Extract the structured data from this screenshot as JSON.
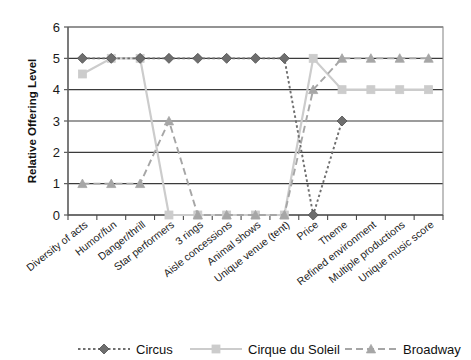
{
  "chart_data": {
    "type": "line",
    "title": "",
    "xlabel": "",
    "ylabel": "Relative Offering Level",
    "ylim": [
      0,
      6
    ],
    "yticks": [
      0,
      1,
      2,
      3,
      4,
      5,
      6
    ],
    "grid": true,
    "legend_position": "bottom",
    "categories": [
      "Diversity of acts",
      "Humor/fun",
      "Danger/thrill",
      "Star performers",
      "3 rings",
      "Aisle concessions",
      "Animal shows",
      "Unique venue (tent)",
      "Price",
      "Theme",
      "Refined environment",
      "Multiple productions",
      "Unique music score"
    ],
    "series": [
      {
        "name": "Circus",
        "color": "#6e6e6e",
        "marker": "diamond",
        "line_style": "dotted",
        "values": [
          5,
          5,
          5,
          5,
          5,
          5,
          5,
          5,
          0,
          3,
          null,
          null,
          null
        ]
      },
      {
        "name": "Cirque du Soleil",
        "color": "#cccccc",
        "marker": "square",
        "line_style": "solid",
        "values": [
          4.5,
          5,
          5,
          0,
          0,
          0,
          0,
          0,
          5,
          4,
          4,
          4,
          4
        ]
      },
      {
        "name": "Broadway",
        "color": "#a6a6a6",
        "marker": "triangle",
        "line_style": "dashed",
        "values": [
          1,
          1,
          1,
          3,
          0,
          0,
          0,
          0,
          4,
          5,
          5,
          5,
          5
        ]
      }
    ]
  },
  "legend": {
    "entries": [
      {
        "label": "Circus"
      },
      {
        "label": "Cirque du Soleil"
      },
      {
        "label": "Broadway"
      }
    ]
  },
  "axis": {
    "y_title": "Relative Offering Level"
  }
}
